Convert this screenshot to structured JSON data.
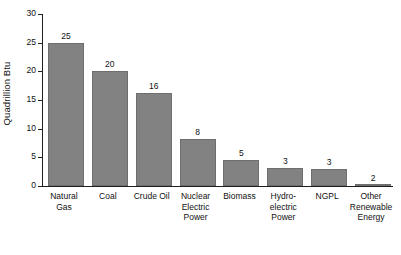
{
  "chart_data": {
    "type": "bar",
    "title": "",
    "subtitle": "",
    "xlabel": "",
    "ylabel": "Quadrillion Btu",
    "ylim": [
      0,
      30
    ],
    "yticks": [
      0,
      5,
      10,
      15,
      20,
      25,
      30
    ],
    "ytick_labels": [
      "0",
      "5",
      "10",
      "15",
      "20",
      "25",
      "30"
    ],
    "grid": false,
    "legend": false,
    "legend_position": "none",
    "bar_color": "#828282",
    "bar_edge_color": "#6e6e6e",
    "axis_color": "#1f1f1f",
    "background_color": "#ffffff",
    "categories": [
      "Natural Gas",
      "Coal",
      "Crude Oil",
      "Nuclear Electric Power",
      "Biomass",
      "Hydro-electric Power",
      "NGPL",
      "Other Renewable Energy"
    ],
    "category_lines": [
      [
        "Natural",
        "Gas"
      ],
      [
        "Coal"
      ],
      [
        "Crude Oil"
      ],
      [
        "Nuclear",
        "Electric",
        "Power"
      ],
      [
        "Biomass"
      ],
      [
        "Hydro-",
        "electric",
        "Power"
      ],
      [
        "NGPL"
      ],
      [
        "Other",
        "Renewable",
        "Energy"
      ]
    ],
    "values": [
      25,
      20,
      16,
      8,
      5,
      3,
      3,
      2
    ],
    "value_labels": [
      "25",
      "20",
      "16",
      "8",
      "5",
      "3",
      "3",
      "2"
    ],
    "plotted_heights": [
      24.9,
      20.0,
      16.2,
      8.2,
      4.5,
      3.1,
      2.9,
      0.2
    ]
  }
}
